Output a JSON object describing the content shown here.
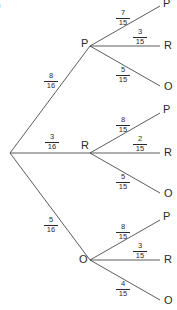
{
  "corner_mark": ")",
  "tree": {
    "first_level": [
      {
        "label": "P",
        "prob_num": "8",
        "prob_den": "16",
        "children": [
          {
            "label": "P",
            "prob_num": "7",
            "prob_den": "15"
          },
          {
            "label": "R",
            "prob_num": "3",
            "prob_den": "15"
          },
          {
            "label": "O",
            "prob_num": "5",
            "prob_den": "15"
          }
        ]
      },
      {
        "label": "R",
        "prob_num": "3",
        "prob_den": "16",
        "children": [
          {
            "label": "P",
            "prob_num": "8",
            "prob_den": "15"
          },
          {
            "label": "R",
            "prob_num": "2",
            "prob_den": "15"
          },
          {
            "label": "O",
            "prob_num": "5",
            "prob_den": "15"
          }
        ]
      },
      {
        "label": "O",
        "prob_num": "5",
        "prob_den": "16",
        "children": [
          {
            "label": "P",
            "prob_num": "8",
            "prob_den": "15"
          },
          {
            "label": "R",
            "prob_num": "3",
            "prob_den": "15"
          },
          {
            "label": "O",
            "prob_num": "4",
            "prob_den": "15"
          }
        ]
      }
    ]
  },
  "colors": {
    "line": "#4a4a4a",
    "text": "#2b2b2b"
  }
}
